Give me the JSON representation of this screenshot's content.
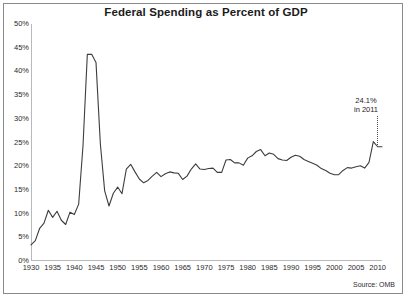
{
  "figure": {
    "title": "Federal Spending as Percent of GDP",
    "source_note": "Source: OMB",
    "annotation_line1": "24.1%",
    "annotation_line2": "in 2011"
  },
  "chart_data": {
    "type": "line",
    "title": "Federal Spending as Percent of GDP",
    "xlabel": "",
    "ylabel": "",
    "xlim": [
      1930,
      2011
    ],
    "ylim": [
      0,
      50
    ],
    "ytick_labels": [
      "0%",
      "5%",
      "10%",
      "15%",
      "20%",
      "25%",
      "30%",
      "35%",
      "40%",
      "45%",
      "50%"
    ],
    "ytick_values": [
      0,
      5,
      10,
      15,
      20,
      25,
      30,
      35,
      40,
      45,
      50
    ],
    "xtick_labels": [
      "1930",
      "1935",
      "1940",
      "1945",
      "1950",
      "1955",
      "1960",
      "1965",
      "1970",
      "1975",
      "1980",
      "1985",
      "1990",
      "1995",
      "2000",
      "2005",
      "2010"
    ],
    "xtick_values": [
      1930,
      1935,
      1940,
      1945,
      1950,
      1955,
      1960,
      1965,
      1970,
      1975,
      1980,
      1985,
      1990,
      1995,
      2000,
      2005,
      2010
    ],
    "grid": false,
    "legend": false,
    "line_color": "#3d3d3d",
    "annotations": [
      {
        "text": "24.1% in 2011",
        "x": 2011,
        "y": 24.1
      }
    ],
    "x": [
      1930,
      1931,
      1932,
      1933,
      1934,
      1935,
      1936,
      1937,
      1938,
      1939,
      1940,
      1941,
      1942,
      1943,
      1944,
      1945,
      1946,
      1947,
      1948,
      1949,
      1950,
      1951,
      1952,
      1953,
      1954,
      1955,
      1956,
      1957,
      1958,
      1959,
      1960,
      1961,
      1962,
      1963,
      1964,
      1965,
      1966,
      1967,
      1968,
      1969,
      1970,
      1971,
      1972,
      1973,
      1974,
      1975,
      1976,
      1977,
      1978,
      1979,
      1980,
      1981,
      1982,
      1983,
      1984,
      1985,
      1986,
      1987,
      1988,
      1989,
      1990,
      1991,
      1992,
      1993,
      1994,
      1995,
      1996,
      1997,
      1998,
      1999,
      2000,
      2001,
      2002,
      2003,
      2004,
      2005,
      2006,
      2007,
      2008,
      2009,
      2010,
      2011
    ],
    "values": [
      3.4,
      4.3,
      6.9,
      8.0,
      10.7,
      9.2,
      10.5,
      8.6,
      7.7,
      10.3,
      9.8,
      12.0,
      24.3,
      43.6,
      43.6,
      41.9,
      24.8,
      14.8,
      11.6,
      14.3,
      15.6,
      14.2,
      19.4,
      20.4,
      18.8,
      17.3,
      16.5,
      17.0,
      17.9,
      18.7,
      17.8,
      18.4,
      18.8,
      18.6,
      18.5,
      17.2,
      17.9,
      19.4,
      20.5,
      19.4,
      19.3,
      19.5,
      19.6,
      18.7,
      18.7,
      21.3,
      21.4,
      20.7,
      20.7,
      20.2,
      21.7,
      22.2,
      23.1,
      23.5,
      22.2,
      22.8,
      22.5,
      21.6,
      21.3,
      21.2,
      21.9,
      22.3,
      22.1,
      21.4,
      21.0,
      20.6,
      20.2,
      19.5,
      19.1,
      18.5,
      18.2,
      18.2,
      19.1,
      19.7,
      19.6,
      19.9,
      20.1,
      19.6,
      20.8,
      25.2,
      24.1,
      24.1
    ]
  }
}
